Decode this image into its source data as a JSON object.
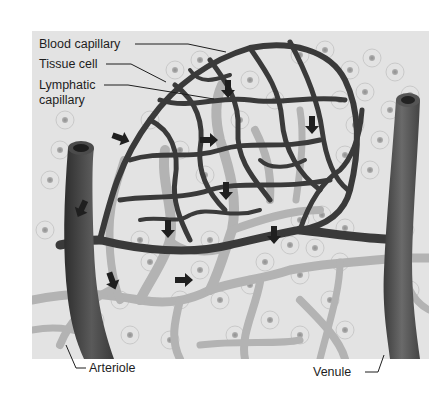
{
  "figure": {
    "type": "illustration",
    "labels": {
      "blood_capillary": "Blood capillary",
      "tissue_cell": "Tissue cell",
      "lymphatic_line1": "Lymphatic",
      "lymphatic_line2": "capillary",
      "arteriole": "Arteriole",
      "venule": "Venule"
    },
    "colors": {
      "background": "#e4e4e4",
      "blood_vessel": "#3a3a3a",
      "arteriole": "#4a4a4a",
      "venule": "#555555",
      "lymphatic": "#b5b5b5",
      "cell_outline": "#c8c8c8",
      "cell_nucleus": "#9a9a9a",
      "arrow": "#222222"
    },
    "arrows": [
      {
        "x": 228,
        "y": 88,
        "dir": "down"
      },
      {
        "x": 312,
        "y": 124,
        "dir": "down"
      },
      {
        "x": 210,
        "y": 140,
        "dir": "right"
      },
      {
        "x": 124,
        "y": 138,
        "dir": "right"
      },
      {
        "x": 82,
        "y": 208,
        "dir": "down"
      },
      {
        "x": 168,
        "y": 228,
        "dir": "down"
      },
      {
        "x": 226,
        "y": 190,
        "dir": "down"
      },
      {
        "x": 274,
        "y": 234,
        "dir": "down"
      },
      {
        "x": 112,
        "y": 280,
        "dir": "down"
      },
      {
        "x": 185,
        "y": 280,
        "dir": "right"
      }
    ]
  }
}
